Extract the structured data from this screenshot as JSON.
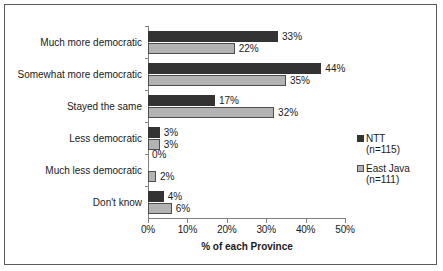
{
  "chart_data": {
    "type": "bar",
    "orientation": "horizontal",
    "title": "",
    "xlabel": "% of each Province",
    "ylabel": "",
    "xlim": [
      0,
      50
    ],
    "grid": false,
    "legend_position": "right",
    "categories": [
      "Much more democratic",
      "Somewhat more democratic",
      "Stayed the same",
      "Less democratic",
      "Much less democratic",
      "Don't know"
    ],
    "tick_labels": [
      "0%",
      "10%",
      "20%",
      "30%",
      "40%",
      "50%"
    ],
    "tick_values": [
      0,
      10,
      20,
      30,
      40,
      50
    ],
    "series": [
      {
        "name": "NTT",
        "sublabel": "(n=115)",
        "color": "#333333",
        "values": [
          33,
          44,
          17,
          3,
          0,
          4
        ],
        "labels": [
          "33%",
          "44%",
          "17%",
          "3%",
          "0%",
          "4%"
        ]
      },
      {
        "name": "East Java",
        "sublabel": "(n=111)",
        "color": "#b3b3b3",
        "values": [
          22,
          35,
          32,
          3,
          2,
          6
        ],
        "labels": [
          "22%",
          "35%",
          "32%",
          "3%",
          "2%",
          "6%"
        ]
      }
    ]
  }
}
